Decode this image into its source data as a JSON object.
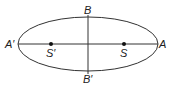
{
  "diagram": {
    "type": "ellipse-with-axes",
    "labels": {
      "top": "B",
      "bottom": "B′",
      "left": "A′",
      "right": "A",
      "focus_left": "S′",
      "focus_right": "S"
    },
    "colors": {
      "stroke": "#333333",
      "text": "#222222"
    }
  }
}
